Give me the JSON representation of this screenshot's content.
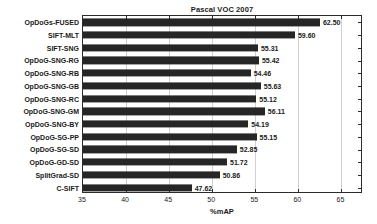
{
  "chart_data": {
    "type": "bar",
    "orientation": "horizontal",
    "title": "Pascal VOC 2007",
    "xlabel": "%mAP",
    "ylabel": "",
    "xlim": [
      35,
      67.5
    ],
    "ylim": [
      0,
      14
    ],
    "grid": true,
    "legend": null,
    "xticks": [
      35,
      40,
      45,
      50,
      55,
      60,
      65
    ],
    "xtick_labels": [
      "35",
      "40",
      "45",
      "50",
      "55",
      "60",
      "65"
    ],
    "bar_color": "#262626",
    "categories": [
      "OpDoGs-FUSED",
      "SIFT-MLT",
      "SIFT-SNG",
      "OpDoG-SNG-RG",
      "OpDoG-SNG-RB",
      "OpDoG-SNG-GB",
      "OpDoG-SNG-RC",
      "OpDoG-SNG-GM",
      "OpDoG-SNG-BY",
      "OpDoG-SG-PP",
      "OpDoG-SG-SD",
      "OpDoG-GD-SD",
      "SplitGrad-SD",
      "C-SIFT"
    ],
    "values": [
      62.5,
      59.6,
      55.31,
      55.42,
      54.46,
      55.63,
      55.12,
      56.11,
      54.19,
      55.15,
      52.85,
      51.72,
      50.86,
      47.62
    ],
    "value_labels": [
      "62.50",
      "59.60",
      "55.31",
      "55.42",
      "54.46",
      "55.63",
      "55.12",
      "56.11",
      "54.19",
      "55.15",
      "52.85",
      "51.72",
      "50.86",
      "47.62"
    ]
  }
}
